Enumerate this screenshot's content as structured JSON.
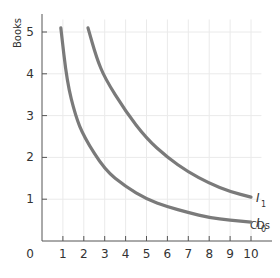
{
  "chart_data": {
    "type": "line",
    "title": "",
    "xlabel": "CDs",
    "ylabel": "Books",
    "xlim": [
      0,
      10.5
    ],
    "ylim": [
      0,
      5.3
    ],
    "x_ticks": [
      1,
      2,
      3,
      4,
      5,
      6,
      7,
      8,
      9,
      10
    ],
    "y_ticks": [
      1,
      2,
      3,
      4,
      5
    ],
    "origin_label": "0",
    "grid": true,
    "series": [
      {
        "name": "I0",
        "label": "I",
        "subscript": "0",
        "color": "#7a7a7a",
        "points": [
          [
            0.9,
            5.1
          ],
          [
            1.2,
            3.8
          ],
          [
            1.6,
            3.0
          ],
          [
            2,
            2.5
          ],
          [
            3,
            1.7
          ],
          [
            4,
            1.3
          ],
          [
            5,
            1.0
          ],
          [
            6,
            0.82
          ],
          [
            7,
            0.68
          ],
          [
            8,
            0.56
          ],
          [
            9,
            0.5
          ],
          [
            10,
            0.45
          ]
        ]
      },
      {
        "name": "I1",
        "label": "I",
        "subscript": "1",
        "color": "#7a7a7a",
        "points": [
          [
            2.2,
            5.1
          ],
          [
            2.6,
            4.4
          ],
          [
            3,
            3.9
          ],
          [
            4,
            3.1
          ],
          [
            5,
            2.45
          ],
          [
            6,
            2.0
          ],
          [
            7,
            1.65
          ],
          [
            8,
            1.38
          ],
          [
            9,
            1.18
          ],
          [
            10,
            1.05
          ]
        ]
      }
    ]
  }
}
